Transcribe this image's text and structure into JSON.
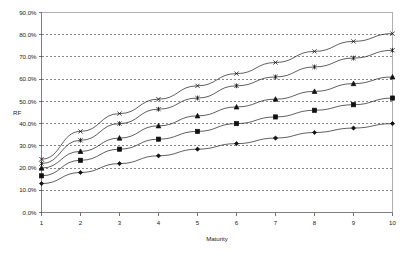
{
  "chart_data": {
    "type": "line",
    "title": "",
    "xlabel": "Maturity",
    "ylabel": "RF",
    "x": [
      1,
      2,
      3,
      4,
      5,
      6,
      7,
      8,
      9,
      10
    ],
    "xtick_labels": [
      "1",
      "2",
      "3",
      "4",
      "5",
      "6",
      "7",
      "8",
      "9",
      "10"
    ],
    "ytick_labels": [
      "0.0%",
      "10.0%",
      "20.0%",
      "30.0%",
      "40.0%",
      "50.0%",
      "60.0%",
      "70.0%",
      "80.0%",
      "90.0%"
    ],
    "ytick_values": [
      0,
      10,
      20,
      30,
      40,
      50,
      60,
      70,
      80,
      90
    ],
    "xlim": [
      1,
      10
    ],
    "ylim": [
      0,
      90
    ],
    "grid": "horizontal-dashed",
    "legend": "none",
    "series": [
      {
        "name": "series-1",
        "marker": "cross-x",
        "values": [
          24.0,
          36.5,
          44.5,
          51.0,
          57.0,
          62.5,
          67.5,
          72.5,
          77.0,
          80.5
        ]
      },
      {
        "name": "series-2",
        "marker": "asterisk",
        "values": [
          22.0,
          32.5,
          40.0,
          46.5,
          51.5,
          57.0,
          61.0,
          65.5,
          69.5,
          73.0
        ]
      },
      {
        "name": "series-3",
        "marker": "triangle",
        "values": [
          20.0,
          27.5,
          33.5,
          39.0,
          43.5,
          47.5,
          51.0,
          54.5,
          58.0,
          61.0
        ]
      },
      {
        "name": "series-4",
        "marker": "square",
        "values": [
          16.5,
          23.5,
          28.5,
          33.0,
          36.5,
          40.0,
          43.0,
          46.0,
          48.5,
          51.5
        ]
      },
      {
        "name": "series-5",
        "marker": "diamond",
        "values": [
          13.0,
          18.0,
          22.0,
          25.5,
          28.5,
          31.0,
          33.5,
          36.0,
          38.0,
          40.0
        ]
      }
    ],
    "colors": {
      "line": "#2b2b2b",
      "marker": "#111111",
      "grid": "#555555",
      "axis": "#808080",
      "plot_border": "#b0b0b0",
      "background": "#ffffff"
    }
  }
}
